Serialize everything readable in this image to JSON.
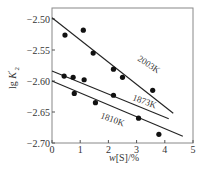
{
  "chart_data": {
    "type": "scatter",
    "title": "",
    "xlabel": "w[S]/%",
    "ylabel": "lg K'2",
    "xlim": [
      0,
      5
    ],
    "ylim": [
      -2.7,
      -2.5
    ],
    "x_ticks": [
      "0",
      "1",
      "2",
      "3",
      "4",
      "5"
    ],
    "y_ticks": [
      "-2.50",
      "-2.55",
      "-2.60",
      "-2.65",
      "-2.70"
    ],
    "grid": false,
    "series": [
      {
        "name": "2003K",
        "points": [
          [
            0.46,
            -2.526
          ],
          [
            1.11,
            -2.518
          ],
          [
            1.46,
            -2.555
          ],
          [
            2.18,
            -2.581
          ],
          [
            2.5,
            -2.594
          ],
          [
            3.57,
            -2.615
          ]
        ],
        "fit_line": [
          [
            0.0,
            -2.498
          ],
          [
            4.3,
            -2.652
          ]
        ]
      },
      {
        "name": "1873K",
        "points": [
          [
            0.43,
            -2.592
          ],
          [
            0.75,
            -2.594
          ],
          [
            1.14,
            -2.598
          ],
          [
            2.18,
            -2.623
          ],
          [
            3.07,
            -2.66
          ]
        ],
        "fit_line": [
          [
            0.0,
            -2.584
          ],
          [
            4.14,
            -2.661
          ]
        ]
      },
      {
        "name": "1810K",
        "points": [
          [
            0.79,
            -2.62
          ],
          [
            1.54,
            -2.635
          ],
          [
            3.79,
            -2.686
          ]
        ],
        "fit_line": [
          [
            0.0,
            -2.6
          ],
          [
            4.64,
            -2.689
          ]
        ]
      }
    ]
  }
}
